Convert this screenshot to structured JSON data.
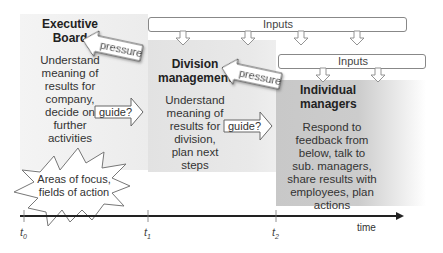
{
  "panels": {
    "executive": {
      "title": [
        "Executive",
        "Board"
      ],
      "body": [
        "Understand",
        "meaning of",
        "results for",
        "company,",
        "decide on",
        "further",
        "activities"
      ]
    },
    "division": {
      "title": [
        "Division",
        "management"
      ],
      "body": [
        "Understand",
        "meaning of",
        "results for",
        "division,",
        "plan next",
        "steps"
      ]
    },
    "individual": {
      "title": [
        "Individual",
        "managers"
      ],
      "body": [
        "Respond to",
        "feedback from",
        "below, talk to",
        "sub. managers,",
        "share results with",
        "employees, plan",
        "actions"
      ]
    }
  },
  "inputs": {
    "top_label": "Inputs",
    "lower_label": "Inputs"
  },
  "arrows": {
    "pressure_1": "pressure",
    "pressure_2": "pressure",
    "guide_1": "guide?",
    "guide_2": "guide?"
  },
  "starburst": {
    "line1": "Areas of focus,",
    "line2": "fields of action"
  },
  "timeline": {
    "ticks": [
      {
        "base": "t",
        "sub": "0"
      },
      {
        "base": "t",
        "sub": "1"
      },
      {
        "base": "t",
        "sub": "2"
      }
    ],
    "axis_label": "time"
  },
  "colors": {
    "exec_panel": "#f0f0f0",
    "division_panel": "#e6e6e6",
    "individual_panel": "#cacaca",
    "outline": "#777777",
    "axis": "#222222"
  }
}
